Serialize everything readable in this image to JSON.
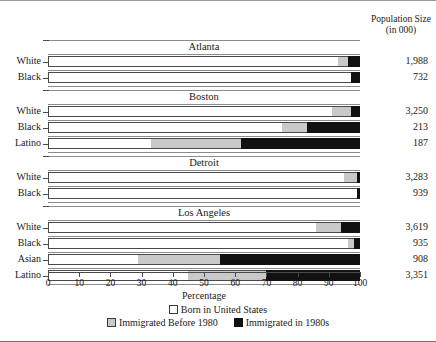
{
  "chart_data": {
    "type": "bar",
    "orientation": "horizontal",
    "stacked": true,
    "title": "",
    "xlabel": "Percentage",
    "ylabel": "",
    "xlim": [
      0,
      100
    ],
    "xticks": [
      0,
      10,
      20,
      30,
      40,
      50,
      60,
      70,
      80,
      90,
      100
    ],
    "grid": false,
    "legend_position": "bottom",
    "series": [
      {
        "name": "Born in United States",
        "color": "#ffffff"
      },
      {
        "name": "Immigrated Before 1980",
        "color": "#c9c9c9"
      },
      {
        "name": "Immigrated in 1980s",
        "color": "#111111"
      }
    ],
    "population_header": [
      "Population Size",
      "(in 000)"
    ],
    "groups": [
      {
        "name": "Atlanta",
        "rows": [
          {
            "label": "White",
            "values": [
              93,
              3,
              4
            ],
            "population": "1,988"
          },
          {
            "label": "Black",
            "values": [
              97,
              0,
              3
            ],
            "population": "732"
          }
        ]
      },
      {
        "name": "Boston",
        "rows": [
          {
            "label": "White",
            "values": [
              91,
              6,
              3
            ],
            "population": "3,250"
          },
          {
            "label": "Black",
            "values": [
              75,
              8,
              17
            ],
            "population": "213"
          },
          {
            "label": "Latino",
            "values": [
              33,
              29,
              38
            ],
            "population": "187"
          }
        ]
      },
      {
        "name": "Detroit",
        "rows": [
          {
            "label": "White",
            "values": [
              95,
              4,
              1
            ],
            "population": "3,283"
          },
          {
            "label": "Black",
            "values": [
              99,
              0,
              1
            ],
            "population": "939"
          }
        ]
      },
      {
        "name": "Los Angeles",
        "rows": [
          {
            "label": "White",
            "values": [
              86,
              8,
              6
            ],
            "population": "3,619"
          },
          {
            "label": "Black",
            "values": [
              96,
              2,
              2
            ],
            "population": "935"
          },
          {
            "label": "Asian",
            "values": [
              29,
              26,
              45
            ],
            "population": "908"
          },
          {
            "label": "Latino",
            "values": [
              45,
              25,
              30
            ],
            "population": "3,351"
          }
        ]
      }
    ]
  }
}
